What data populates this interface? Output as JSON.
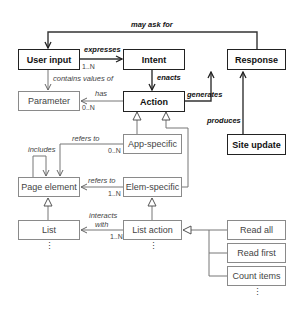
{
  "nodes": {
    "user_input": "User input",
    "intent": "Intent",
    "response": "Response",
    "parameter": "Parameter",
    "action": "Action",
    "app_specific": "App-specific",
    "site_update": "Site update",
    "page_element": "Page element",
    "elem_specific": "Elem-specific",
    "list": "List",
    "list_action": "List action",
    "read_all": "Read all",
    "read_first": "Read first",
    "count_items": "Count items"
  },
  "edges": {
    "may_ask_for": "may ask for",
    "expresses": "expresses",
    "enacts": "enacts",
    "generates": "generates",
    "produces": "produces",
    "contains_values_of": "contains values of",
    "has": "has",
    "includes": "includes",
    "refers_to_app": "refers to",
    "refers_to_elem": "refers to",
    "interacts_with_1": "interacts",
    "interacts_with_2": "with"
  },
  "multiplicities": {
    "expresses": "1..N",
    "has": "0..N",
    "refers_to_app": "0..N",
    "refers_to_elem": "1..N",
    "interacts_with": "1..N"
  },
  "ellipsis": "⋮",
  "colors": {
    "bold_border": "#222222",
    "thin_border": "#8a8a8a",
    "line": "#333333",
    "light_line": "#777777"
  }
}
